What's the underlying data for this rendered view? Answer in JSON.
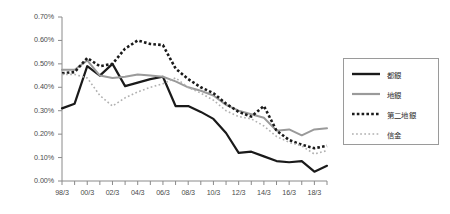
{
  "chart_data": {
    "type": "line",
    "title": "",
    "xlabel": "",
    "ylabel": "",
    "ylim": [
      0,
      0.007
    ],
    "ytick_labels": [
      "0.70%",
      "0.60%",
      "0.50%",
      "0.40%",
      "0.30%",
      "0.20%",
      "0.10%",
      "0.00%"
    ],
    "ytick_values": [
      0.7,
      0.6,
      0.5,
      0.4,
      0.3,
      0.2,
      0.1,
      0.0
    ],
    "value_unit": "percent",
    "grid": false,
    "legend_position": "right",
    "x": [
      "98/3",
      "99/3",
      "00/3",
      "01/3",
      "02/3",
      "03/3",
      "04/3",
      "05/3",
      "06/3",
      "07/3",
      "08/3",
      "09/3",
      "10/3",
      "11/3",
      "12/3",
      "13/3",
      "14/3",
      "15/3",
      "16/3",
      "17/3",
      "18/3",
      "19/3"
    ],
    "xtick_labels": [
      "98/3",
      "00/3",
      "02/3",
      "04/3",
      "06/3",
      "08/3",
      "10/3",
      "12/3",
      "14/3",
      "16/3",
      "18/3"
    ],
    "xtick_indices": [
      0,
      2,
      4,
      6,
      8,
      10,
      12,
      14,
      16,
      18,
      20
    ],
    "series": [
      {
        "name": "都銀",
        "style": "solid",
        "color": "#1a1a1a",
        "width": 2.2,
        "values": [
          0.31,
          0.33,
          0.49,
          0.45,
          0.5,
          0.405,
          0.42,
          0.435,
          0.445,
          0.32,
          0.32,
          0.295,
          0.265,
          0.205,
          0.12,
          0.125,
          0.105,
          0.085,
          0.08,
          0.085,
          0.04,
          0.065
        ]
      },
      {
        "name": "地銀",
        "style": "solid",
        "color": "#9a9a9a",
        "width": 2.0,
        "values": [
          0.475,
          0.475,
          0.515,
          0.45,
          0.44,
          0.445,
          0.455,
          0.45,
          0.445,
          0.425,
          0.4,
          0.385,
          0.365,
          0.325,
          0.3,
          0.285,
          0.27,
          0.215,
          0.22,
          0.195,
          0.22,
          0.225
        ]
      },
      {
        "name": "第二地銀",
        "style": "dotted-bold",
        "color": "#1a1a1a",
        "width": 2.6,
        "values": [
          0.46,
          0.465,
          0.525,
          0.49,
          0.5,
          0.565,
          0.6,
          0.585,
          0.58,
          0.48,
          0.435,
          0.4,
          0.375,
          0.33,
          0.295,
          0.275,
          0.32,
          0.215,
          0.175,
          0.155,
          0.14,
          0.15
        ]
      },
      {
        "name": "信金",
        "style": "dotted-fine",
        "color": "#b0b0b0",
        "width": 1.6,
        "values": [
          0.455,
          0.455,
          0.44,
          0.365,
          0.32,
          0.355,
          0.38,
          0.4,
          0.415,
          0.44,
          0.4,
          0.375,
          0.345,
          0.3,
          0.275,
          0.265,
          0.235,
          0.19,
          0.165,
          0.15,
          0.115,
          0.13
        ]
      }
    ]
  },
  "legend": {
    "entries": [
      {
        "label": "都銀"
      },
      {
        "label": "地銀"
      },
      {
        "label": "第二地銀"
      },
      {
        "label": "信金"
      }
    ]
  }
}
